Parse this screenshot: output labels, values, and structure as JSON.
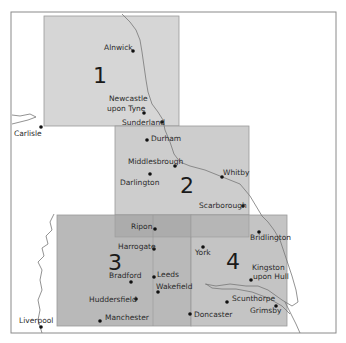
{
  "map": {
    "frame": {
      "x": 11,
      "y": 12,
      "w": 325,
      "h": 321
    },
    "colors": {
      "background": "#ffffff",
      "frame": "#8a8a8a",
      "region_light": "#d6d6d6",
      "region_mid": "#c9c9c9",
      "region_dark": "#b9b9b9",
      "overlap": "#ababab",
      "city_dot": "#111111"
    },
    "regions": [
      {
        "id": "1",
        "label": "1",
        "x": 44,
        "y": 16,
        "w": 135,
        "h": 110
      },
      {
        "id": "2",
        "label": "2",
        "x": 115,
        "y": 126,
        "w": 134,
        "h": 89
      },
      {
        "id": "3",
        "label": "3",
        "x": 57,
        "y": 215,
        "w": 134,
        "h": 111
      },
      {
        "id": "4",
        "label": "4",
        "x": 191,
        "y": 215,
        "w": 96,
        "h": 111
      }
    ],
    "cities": [
      {
        "name": "Alnwick",
        "x": 133,
        "y": 51
      },
      {
        "name": "Newcastle",
        "line2": "upon Tyne",
        "x": 144,
        "y": 113
      },
      {
        "name": "Sunderland",
        "x": 162,
        "y": 122
      },
      {
        "name": "Carlisle",
        "x": 41,
        "y": 127
      },
      {
        "name": "Durham",
        "x": 147,
        "y": 140
      },
      {
        "name": "Middlesbrough",
        "x": 175,
        "y": 166
      },
      {
        "name": "Darlington",
        "x": 150,
        "y": 174
      },
      {
        "name": "Whitby",
        "x": 247,
        "y": 176
      },
      {
        "name": "Scarborough",
        "x": 257,
        "y": 206
      },
      {
        "name": "Ripon",
        "x": 155,
        "y": 229
      },
      {
        "name": "Bridlington",
        "x": 259,
        "y": 231
      },
      {
        "name": "Harrogate",
        "x": 154,
        "y": 249
      },
      {
        "name": "York",
        "x": 202,
        "y": 248
      },
      {
        "name": "Bradford",
        "x": 131,
        "y": 282
      },
      {
        "name": "Leeds",
        "x": 154,
        "y": 277
      },
      {
        "name": "Kingston",
        "line2": "upon Hull",
        "x": 251,
        "y": 281
      },
      {
        "name": "Wakefield",
        "x": 158,
        "y": 293
      },
      {
        "name": "Huddersfield",
        "x": 135,
        "y": 299
      },
      {
        "name": "Scunthorpe",
        "x": 227,
        "y": 302
      },
      {
        "name": "Grimsby",
        "x": 276,
        "y": 307
      },
      {
        "name": "Manchester",
        "x": 101,
        "y": 320
      },
      {
        "name": "Doncaster",
        "x": 190,
        "y": 315
      },
      {
        "name": "Liverpool",
        "x": 41,
        "y": 327
      }
    ]
  }
}
